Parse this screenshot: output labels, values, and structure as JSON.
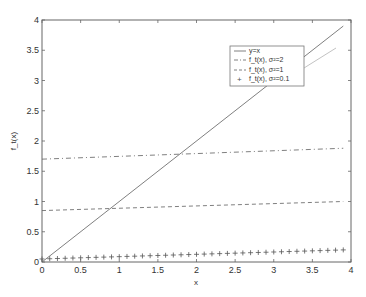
{
  "chart_data": {
    "type": "line",
    "title": "",
    "xlabel": "x",
    "ylabel": "f_t(x)",
    "xlim": [
      0,
      4
    ],
    "ylim": [
      0,
      4
    ],
    "grid": false,
    "legend_position": "upper-right (inset)",
    "xticks": [
      "0",
      "0.5",
      "1",
      "1.5",
      "2",
      "2.5",
      "3",
      "3.5",
      "4"
    ],
    "yticks": [
      "0",
      "0.5",
      "1",
      "1.5",
      "2",
      "2.5",
      "3",
      "3.5",
      "4"
    ],
    "series": [
      {
        "name": "y=x",
        "style": "solid",
        "x": [
          0,
          3.9
        ],
        "y": [
          0,
          3.9
        ]
      },
      {
        "name": "f_t(x), σ²=2",
        "style": "dash-dot",
        "x": [
          0,
          3.9
        ],
        "y": [
          1.7,
          1.88
        ]
      },
      {
        "name": "f_t(x), σ²=1",
        "style": "dashed",
        "x": [
          0,
          3.9
        ],
        "y": [
          0.85,
          1.0
        ]
      },
      {
        "name": "f_t(x), σ²=0.1",
        "style": "plus-markers",
        "x_start": 0,
        "x_end": 3.9,
        "x_step": 0.1,
        "y_start": 0.05,
        "y_end": 0.2
      }
    ]
  },
  "legend": {
    "entries": [
      "y=x",
      "f_t(x), σ²=2",
      "f_t(x), σ²=1",
      "f_t(x), σ²=0.1"
    ]
  },
  "colors": {
    "line": "#808080",
    "axis": "#555555"
  }
}
